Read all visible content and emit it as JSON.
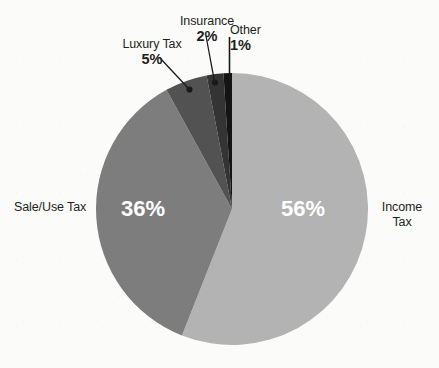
{
  "chart_data": {
    "type": "pie",
    "title": "",
    "subtitle": "",
    "xlabel": "",
    "ylabel": "",
    "legend_position": "callout-labels",
    "grid": false,
    "start_angle_deg": 0,
    "direction": "clockwise",
    "total_label": "100%",
    "categories": [
      "Income Tax",
      "Sale/Use Tax",
      "Luxury Tax",
      "Insurance",
      "Other"
    ],
    "values": [
      56,
      36,
      5,
      2,
      1
    ],
    "value_labels": [
      "56%",
      "36%",
      "5%",
      "2%",
      "1%"
    ],
    "colors": [
      "#b3b3b3",
      "#7d7d7d",
      "#525252",
      "#343434",
      "#141414"
    ],
    "slices": [
      {
        "name": "Income Tax",
        "value": 56,
        "value_label": "56%",
        "color": "#b3b3b3",
        "label_placement": "outside-right",
        "inner_label": "56%",
        "inner_label_color": "#ffffff",
        "has_leader_line": false
      },
      {
        "name": "Sale/Use Tax",
        "value": 36,
        "value_label": "36%",
        "color": "#7d7d7d",
        "label_placement": "outside-left",
        "inner_label": "36%",
        "inner_label_color": "#ffffff",
        "has_leader_line": false
      },
      {
        "name": "Luxury Tax",
        "value": 5,
        "value_label": "5%",
        "color": "#525252",
        "label_placement": "callout-top-left",
        "inner_label": "",
        "inner_label_color": "",
        "has_leader_line": true
      },
      {
        "name": "Insurance",
        "value": 2,
        "value_label": "2%",
        "color": "#343434",
        "label_placement": "callout-top",
        "inner_label": "",
        "inner_label_color": "",
        "has_leader_line": true
      },
      {
        "name": "Other",
        "value": 1,
        "value_label": "1%",
        "color": "#141414",
        "label_placement": "callout-top-right",
        "inner_label": "",
        "inner_label_color": "",
        "has_leader_line": true
      }
    ]
  },
  "labels": {
    "income_tax": {
      "name_line1": "Income",
      "name_line2": "Tax",
      "percent": "56%"
    },
    "sale_use_tax": {
      "name": "Sale/Use Tax",
      "percent": "36%"
    },
    "luxury_tax": {
      "name": "Luxury Tax",
      "percent": "5%"
    },
    "insurance": {
      "name": "Insurance",
      "percent": "2%"
    },
    "other": {
      "name": "Other",
      "percent": "1%"
    }
  },
  "style": {
    "background": "#fbfbfa",
    "text_color": "#231f20",
    "inner_text_color": "#ffffff",
    "leader_line_color": "#1a1a1a"
  }
}
